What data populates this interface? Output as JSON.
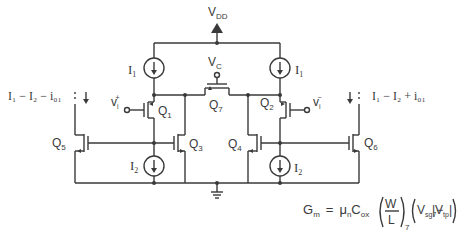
{
  "diagram": {
    "type": "circuit-schematic",
    "supply": {
      "top": "V",
      "top_sub": "DD"
    },
    "control": {
      "label": "V",
      "label_sub": "C"
    },
    "current_sources": {
      "left_top": {
        "label": "I",
        "sub": "1"
      },
      "right_top": {
        "label": "I",
        "sub": "1"
      },
      "left_bottom": {
        "label": "I",
        "sub": "2"
      },
      "right_bottom": {
        "label": "I",
        "sub": "2"
      }
    },
    "transistors": [
      {
        "name": "Q",
        "sub": "1"
      },
      {
        "name": "Q",
        "sub": "2"
      },
      {
        "name": "Q",
        "sub": "3"
      },
      {
        "name": "Q",
        "sub": "4"
      },
      {
        "name": "Q",
        "sub": "5"
      },
      {
        "name": "Q",
        "sub": "6"
      },
      {
        "name": "Q",
        "sub": "7"
      }
    ],
    "inputs": {
      "plus": {
        "label": "v",
        "sub": "i",
        "sup": "+"
      },
      "minus": {
        "label": "v",
        "sub": "i",
        "sup": "−"
      }
    },
    "output_currents": {
      "left": "I₁ − I₂ − i₀₁",
      "right": "I₁ − I₂ + i₀₁"
    },
    "equation": {
      "lhs": "G",
      "lhs_sub": "m",
      "eq": "=",
      "mu": "μ",
      "mu_sub": "n",
      "c": "C",
      "c_sub": "ox",
      "frac_num": "W",
      "frac_den": "L",
      "frac_sub": "7",
      "v1": "V",
      "v1_sub": "sg7",
      "minus": "−",
      "v2": "V",
      "v2_sub": "tp"
    }
  }
}
